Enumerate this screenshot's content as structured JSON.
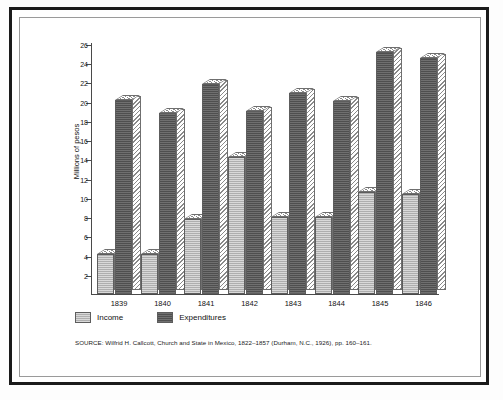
{
  "chart_data": {
    "type": "bar",
    "title": "",
    "subtitle": "",
    "xlabel": "",
    "ylabel": "Millions of pesos",
    "categories": [
      "1839",
      "1840",
      "1841",
      "1842",
      "1843",
      "1844",
      "1845",
      "1846"
    ],
    "series": [
      {
        "name": "Income",
        "color": "#b9b9b9",
        "values": [
          4.2,
          4.2,
          7.8,
          14.2,
          8.0,
          8.0,
          10.6,
          10.4
        ]
      },
      {
        "name": "Expenditures",
        "color": "#585858",
        "values": [
          20.2,
          18.8,
          21.8,
          19.0,
          20.9,
          20.1,
          25.2,
          24.5
        ]
      }
    ],
    "ylim": [
      0,
      26
    ],
    "ytick_step": 2,
    "yticks": [
      2,
      4,
      6,
      8,
      10,
      12,
      14,
      16,
      18,
      20,
      22,
      24,
      26
    ],
    "grid": false,
    "legend_position": "bottom-left",
    "annotations": []
  },
  "legend": {
    "items": [
      {
        "label": "Income",
        "swatch": "income-swatch"
      },
      {
        "label": "Expenditures",
        "swatch": "expenditures-swatch"
      }
    ]
  },
  "source": {
    "text": "SOURCE: Wilfrid H. Callcott, Church and State in Mexico, 1822–1857 (Durham, N.C., 1926), pp. 160–161."
  }
}
